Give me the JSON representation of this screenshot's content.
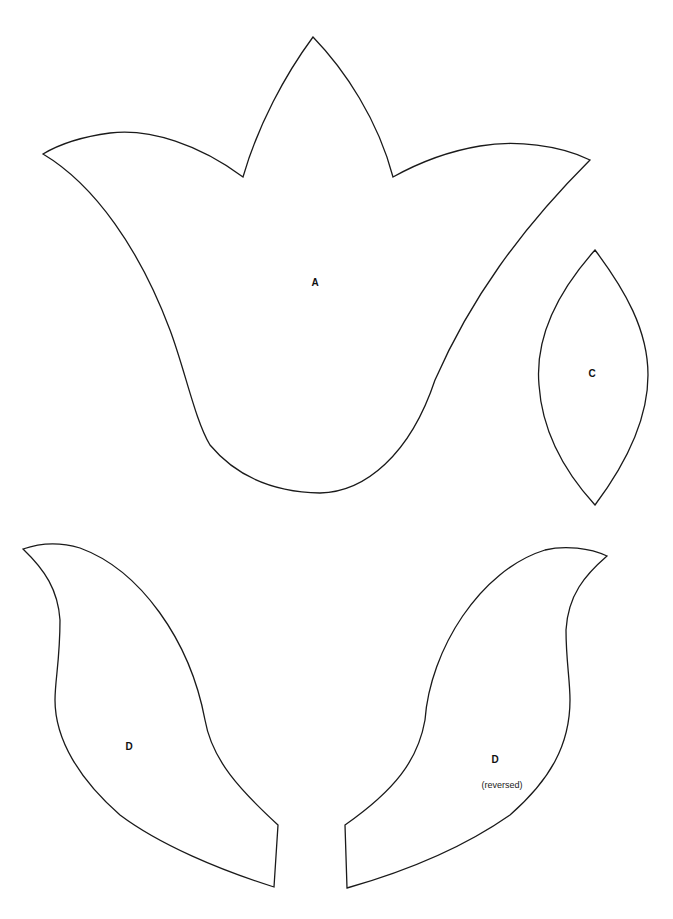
{
  "page": {
    "background": "#ffffff",
    "stroke_color": "#1a1a1a"
  },
  "pieces": {
    "a": {
      "label": "A",
      "description": "tulip flower with three pointed petals"
    },
    "c": {
      "label": "C",
      "description": "pointed oval / vesica leaf"
    },
    "d": {
      "label": "D",
      "description": "curved leaf"
    },
    "d_reversed": {
      "label": "D",
      "sublabel": "(reversed)",
      "description": "mirrored curved leaf"
    }
  }
}
